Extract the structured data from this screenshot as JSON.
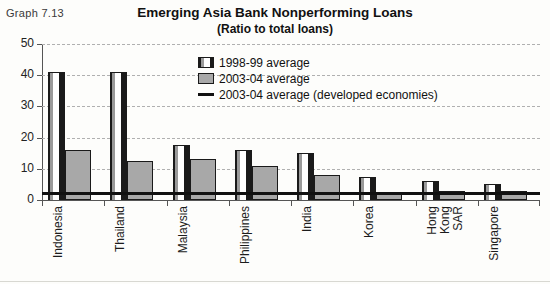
{
  "graph_label": "Graph 7.13",
  "chart_data": {
    "type": "bar",
    "title": "Emerging Asia Bank Nonperforming Loans",
    "subtitle": "(Ratio to total loans)",
    "xlabel": "",
    "ylabel": "",
    "ylim": [
      0,
      50
    ],
    "yticks": [
      0,
      10,
      20,
      30,
      40,
      50
    ],
    "grid": true,
    "legend_position": "top-center",
    "categories": [
      "Indonesia",
      "Thailand",
      "Malaysia",
      "Philippines",
      "India",
      "Korea",
      "Hong Kong SAR",
      "Singapore"
    ],
    "series": [
      {
        "name": "1998-99 average",
        "values": [
          41,
          41,
          17.5,
          16,
          15,
          7.5,
          6,
          5
        ]
      },
      {
        "name": "2003-04 average",
        "values": [
          16,
          12.5,
          13,
          11,
          8,
          2,
          3,
          3
        ]
      }
    ],
    "reference_line": {
      "name": "2003-04 average (developed economies)",
      "value": 2
    }
  },
  "legend": [
    {
      "label": "1998-99 average",
      "swatch": "striped-bar-swatch"
    },
    {
      "label": "2003-04 average",
      "swatch": "gray-bar-swatch"
    },
    {
      "label": "2003-04 average (developed economies)",
      "swatch": "line-swatch"
    }
  ],
  "colors": {
    "bar_1998_edge": "#1a1a1a",
    "bar_1998_stripe": "#9a9a9a",
    "bar_1998_core": "#ffffff",
    "bar_2003_fill": "#a8a8a8",
    "reference_line": "#111111",
    "gridline": "#b0b0b0",
    "axis": "#555555",
    "background": "#fdfdfb"
  }
}
